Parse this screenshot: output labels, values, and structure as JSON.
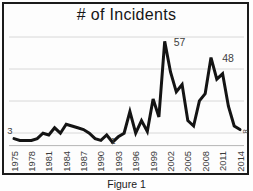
{
  "figure": {
    "caption": "Figure 1"
  },
  "chart_data": {
    "type": "line",
    "title": "# of Incidents",
    "xlabel": "",
    "ylabel": "",
    "legend": "none",
    "grid": true,
    "ylim": [
      0,
      60
    ],
    "years": [
      1975,
      1976,
      1977,
      1978,
      1979,
      1980,
      1981,
      1982,
      1983,
      1984,
      1985,
      1986,
      1987,
      1988,
      1989,
      1990,
      1991,
      1992,
      1993,
      1994,
      1995,
      1996,
      1997,
      1998,
      1999,
      2000,
      2001,
      2002,
      2003,
      2004,
      2005,
      2006,
      2007,
      2008,
      2009,
      2010,
      2011,
      2012,
      2013,
      2014
    ],
    "values": [
      3,
      2,
      2,
      2,
      3,
      6,
      5,
      9,
      6,
      11,
      10,
      9,
      8,
      6,
      3,
      2,
      5,
      1,
      4,
      6,
      18,
      6,
      13,
      7,
      25,
      15,
      57,
      40,
      29,
      33,
      13,
      10,
      24,
      28,
      48,
      36,
      39,
      21,
      10,
      8
    ],
    "x_tick_labels": [
      "1975",
      "1978",
      "1981",
      "1984",
      "1987",
      "1990",
      "1993",
      "1996",
      "1999",
      "2002",
      "2005",
      "2008",
      "2011",
      "2014"
    ],
    "point_labels": [
      {
        "year": 1975,
        "text": "3"
      },
      {
        "year": 1992,
        "text": "1"
      },
      {
        "year": 2001,
        "text": "57"
      },
      {
        "year": 2009,
        "text": "48"
      },
      {
        "year": 2014,
        "text": "8"
      }
    ],
    "line_color": "#141414",
    "grid_color": "#d4d4d4",
    "axis_color": "#b5b5b5",
    "tick_label_color": "#3a3a3a",
    "data_label_color": "#3f3f3f"
  }
}
